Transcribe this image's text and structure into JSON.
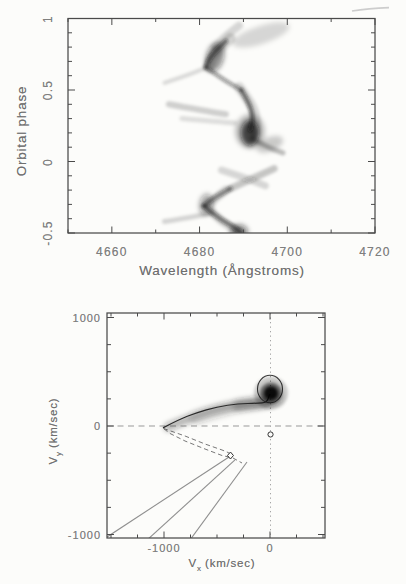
{
  "figure": {
    "bg": "#fcfcfa",
    "frame_color": "#4a4a4a",
    "ink_color": "#111111",
    "dash_color": "#999999",
    "ray_color": "#8f8f8f",
    "lobe_color": "#787878"
  },
  "chart_data": [
    {
      "id": "trailed-spectrogram",
      "type": "heatmap",
      "xlabel": "Wavelength (Ångstroms)",
      "ylabel": "Orbital phase",
      "xlim": [
        4650,
        4720
      ],
      "ylim": [
        -0.5,
        1.0
      ],
      "x_minor_step": 10,
      "y_minor_step": 0.1,
      "x_ticks": [
        {
          "v": 4660,
          "t": "4660"
        },
        {
          "v": 4680,
          "t": "4680"
        },
        {
          "v": 4700,
          "t": "4700"
        },
        {
          "v": 4720,
          "t": "4720"
        }
      ],
      "y_ticks": [
        {
          "v": 1,
          "t": "1"
        },
        {
          "v": 0.5,
          "t": "0.5"
        },
        {
          "v": 0,
          "t": "0"
        },
        {
          "v": -0.5,
          "t": "-0.5"
        }
      ],
      "line_center_wavelength": 4686,
      "trace_segments": [
        {
          "pts": [
            [
              4689,
              0.95
            ],
            [
              4686,
              0.88
            ],
            [
              4683.5,
              0.8
            ]
          ],
          "w": 8,
          "o": 0.15
        },
        {
          "pts": [
            [
              4687,
              0.86
            ],
            [
              4683,
              0.75
            ],
            [
              4682,
              0.66
            ]
          ],
          "w": 11,
          "o": 0.14
        },
        {
          "pts": [
            [
              4686,
              0.84
            ],
            [
              4682.5,
              0.74
            ],
            [
              4681.5,
              0.66
            ]
          ],
          "w": 5,
          "o": 0.5
        },
        {
          "pts": [
            [
              4672,
              0.55
            ],
            [
              4677,
              0.6
            ],
            [
              4681,
              0.65
            ]
          ],
          "w": 4,
          "o": 0.14
        },
        {
          "pts": [
            [
              4681.5,
              0.66
            ],
            [
              4685,
              0.58
            ],
            [
              4689.5,
              0.5
            ]
          ],
          "w": 4,
          "o": 0.4
        },
        {
          "pts": [
            [
              4689,
              0.52
            ],
            [
              4692,
              0.4
            ],
            [
              4693,
              0.28
            ],
            [
              4692.5,
              0.2
            ]
          ],
          "w": 10,
          "o": 0.15
        },
        {
          "pts": [
            [
              4689.5,
              0.5
            ],
            [
              4691.5,
              0.4
            ],
            [
              4692.2,
              0.3
            ],
            [
              4691.5,
              0.22
            ]
          ],
          "w": 4.5,
          "o": 0.55
        },
        {
          "pts": [
            [
              4692,
              0.16
            ],
            [
              4695.5,
              0.1
            ],
            [
              4699,
              0.06
            ]
          ],
          "w": 5,
          "o": 0.26
        },
        {
          "pts": [
            [
              4673,
              0.4
            ],
            [
              4680,
              0.36
            ],
            [
              4686,
              0.33
            ]
          ],
          "w": 6,
          "o": 0.18
        },
        {
          "pts": [
            [
              4676,
              0.3
            ],
            [
              4683,
              0.28
            ],
            [
              4688,
              0.27
            ]
          ],
          "w": 5,
          "o": 0.12
        },
        {
          "pts": [
            [
              4697,
              -0.05
            ],
            [
              4692,
              -0.12
            ],
            [
              4687,
              -0.19
            ]
          ],
          "w": 7,
          "o": 0.22
        },
        {
          "pts": [
            [
              4685,
              -0.06
            ],
            [
              4690,
              -0.11
            ],
            [
              4695,
              -0.17
            ]
          ],
          "w": 7,
          "o": 0.15
        },
        {
          "pts": [
            [
              4687,
              -0.19
            ],
            [
              4683,
              -0.26
            ],
            [
              4681,
              -0.31
            ]
          ],
          "w": 5,
          "o": 0.45
        },
        {
          "pts": [
            [
              4681,
              -0.31
            ],
            [
              4684,
              -0.39
            ],
            [
              4687.5,
              -0.45
            ],
            [
              4689.5,
              -0.5
            ]
          ],
          "w": 5,
          "o": 0.5
        },
        {
          "pts": [
            [
              4686,
              -0.2
            ],
            [
              4682.5,
              -0.28
            ],
            [
              4682,
              -0.33
            ],
            [
              4685,
              -0.42
            ],
            [
              4688.5,
              -0.48
            ]
          ],
          "w": 9,
          "o": 0.14
        },
        {
          "pts": [
            [
              4672,
              -0.42
            ],
            [
              4678,
              -0.39
            ],
            [
              4683,
              -0.36
            ]
          ],
          "w": 5,
          "o": 0.16
        }
      ],
      "blobs": [
        {
          "c": [
            4694,
            0.885
          ],
          "rx": 6.8,
          "ry": 0.063,
          "rot": -18,
          "o": 0.15
        },
        {
          "c": [
            4683.5,
            0.73
          ],
          "rx": 2.05,
          "ry": 0.105,
          "rot": 15,
          "o": 0.45
        },
        {
          "c": [
            4691.5,
            0.21
          ],
          "rx": 3.4,
          "ry": 0.12,
          "rot": 0,
          "o": 0.25
        },
        {
          "c": [
            4691.5,
            0.2
          ],
          "rx": 2.05,
          "ry": 0.091,
          "rot": 0,
          "o": 0.72
        },
        {
          "c": [
            4696,
            0.12
          ],
          "rx": 3.2,
          "ry": 0.049,
          "rot": -22,
          "o": 0.2
        },
        {
          "c": [
            4681.5,
            -0.3
          ],
          "rx": 1.6,
          "ry": 0.077,
          "rot": 8,
          "o": 0.35
        },
        {
          "c": [
            4689,
            -0.49
          ],
          "rx": 2.05,
          "ry": 0.049,
          "rot": 0,
          "o": 0.5
        }
      ]
    },
    {
      "id": "doppler-map",
      "type": "scatter",
      "xlabel_base": "V",
      "xlabel_sub": "x",
      "xlabel_unit": "(km/sec)",
      "ylabel_base": "V",
      "ylabel_sub": "y",
      "ylabel_unit": "(km/sec)",
      "xlim": [
        -1538,
        519
      ],
      "ylim": [
        -1032,
        1041
      ],
      "minor_step": 250,
      "major_step": 1000,
      "x_ticks": [
        {
          "v": -1000,
          "t": "-1000"
        },
        {
          "v": 0,
          "t": "0"
        }
      ],
      "y_ticks": [
        {
          "v": 1000,
          "t": "1000"
        },
        {
          "v": 0,
          "t": "0"
        },
        {
          "v": -1000,
          "t": "-1000"
        }
      ],
      "emission_spot": {
        "center": [
          9,
          304
        ],
        "halo": [
          160,
          150
        ],
        "mid": [
          104,
          96
        ],
        "core": [
          66,
          62
        ]
      },
      "ring": {
        "center": [
          0,
          341
        ],
        "rx": 118,
        "ry": 127
      },
      "stream_curve": [
        [
          -1005,
          -15
        ],
        [
          -860,
          60
        ],
        [
          -700,
          120
        ],
        [
          -500,
          178
        ],
        [
          -300,
          205
        ],
        [
          -120,
          210
        ],
        [
          -30,
          215
        ],
        [
          -5,
          290
        ]
      ],
      "band_strokes": [
        {
          "pts": [
            [
              -960,
              -10
            ],
            [
              -640,
              120
            ],
            [
              -300,
              195
            ],
            [
              -30,
              212
            ]
          ],
          "w": 9,
          "o": 0.3
        },
        {
          "pts": [
            [
              -700,
              75
            ],
            [
              -380,
              175
            ],
            [
              -30,
              225
            ],
            [
              60,
              255
            ]
          ],
          "w": 14,
          "o": 0.14
        },
        {
          "pts": [
            [
              -300,
              190
            ],
            [
              -60,
              210
            ],
            [
              30,
              250
            ]
          ],
          "w": 12,
          "o": 0.22
        }
      ],
      "roche_lobe": [
        [
          -1004,
          -23
        ],
        [
          -802,
          -92
        ],
        [
          -613,
          -166
        ],
        [
          -453,
          -221
        ],
        [
          -396,
          -244
        ],
        [
          -368,
          -263
        ],
        [
          -387,
          -286
        ],
        [
          -453,
          -272
        ],
        [
          -613,
          -212
        ],
        [
          -802,
          -138
        ],
        [
          -943,
          -69
        ]
      ],
      "lobe_tail": [
        [
          -349,
          -295
        ],
        [
          -264,
          -341
        ]
      ],
      "diamond_marker": [
        -373,
        -272
      ],
      "circle_marker": [
        5,
        -78
      ],
      "rays": [
        [
          [
            -1566,
            -1041
          ],
          [
            -358,
            -267
          ]
        ],
        [
          [
            -1160,
            -1051
          ],
          [
            -330,
            -313
          ]
        ],
        [
          [
            -755,
            -1051
          ],
          [
            -217,
            -332
          ]
        ]
      ]
    }
  ]
}
